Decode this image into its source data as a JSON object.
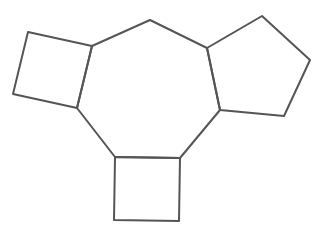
{
  "diagram": {
    "type": "fused-ring-structure",
    "stroke_color": "#555555",
    "background": "#ffffff",
    "central_ring": {
      "shape": "heptagon",
      "points": [
        [
          92,
          46
        ],
        [
          150,
          20
        ],
        [
          207,
          48
        ],
        [
          220,
          110
        ],
        [
          180,
          158
        ],
        [
          115,
          157
        ],
        [
          77,
          108
        ]
      ]
    },
    "rings": [
      {
        "name": "left-square",
        "shape": "square",
        "points": [
          [
            28,
            32
          ],
          [
            92,
            46
          ],
          [
            77,
            108
          ],
          [
            13,
            94
          ]
        ]
      },
      {
        "name": "right-pentagon",
        "shape": "pentagon",
        "points": [
          [
            207,
            48
          ],
          [
            262,
            16
          ],
          [
            310,
            60
          ],
          [
            284,
            116
          ],
          [
            220,
            110
          ]
        ]
      },
      {
        "name": "bottom-square",
        "shape": "square",
        "points": [
          [
            115,
            157
          ],
          [
            180,
            158
          ],
          [
            179,
            221
          ],
          [
            114,
            220
          ]
        ]
      }
    ]
  }
}
